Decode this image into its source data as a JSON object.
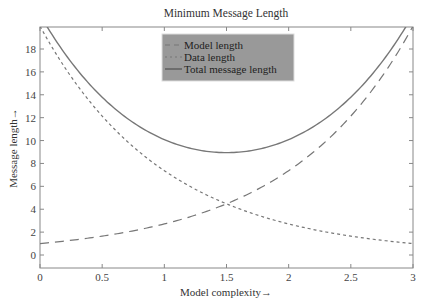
{
  "chart_data": {
    "type": "line",
    "title": "Minimum Message Length",
    "xlabel": "Model complexity→",
    "ylabel": "Message length→",
    "xlim": [
      0,
      3
    ],
    "ylim": [
      -1,
      20
    ],
    "x_ticks": [
      "0",
      "0.5",
      "1",
      "1.5",
      "2",
      "2.5",
      "3"
    ],
    "y_ticks": [
      "0",
      "2",
      "4",
      "6",
      "8",
      "10",
      "12",
      "14",
      "16",
      "18"
    ],
    "grid": false,
    "legend_position": "upper center",
    "x": [
      0,
      0.25,
      0.5,
      0.75,
      1.0,
      1.25,
      1.5,
      1.75,
      2.0,
      2.25,
      2.5,
      2.75,
      3.0
    ],
    "series": [
      {
        "name": "Model length",
        "style": "dashed",
        "values": [
          1.0,
          1.28,
          1.65,
          2.12,
          2.72,
          3.49,
          4.48,
          5.75,
          7.39,
          9.49,
          12.18,
          15.64,
          20.0
        ]
      },
      {
        "name": "Data length",
        "style": "dotted",
        "values": [
          20.0,
          15.58,
          12.13,
          9.45,
          7.36,
          5.73,
          4.46,
          3.48,
          2.71,
          2.11,
          1.64,
          1.28,
          1.0
        ]
      },
      {
        "name": "Total message length",
        "style": "solid",
        "values": [
          21.0,
          16.86,
          13.78,
          11.57,
          10.08,
          9.22,
          8.94,
          9.23,
          10.1,
          11.6,
          13.82,
          16.92,
          21.0
        ]
      }
    ]
  },
  "legend": {
    "items": [
      "Model length",
      "Data length",
      "Total message length"
    ]
  }
}
